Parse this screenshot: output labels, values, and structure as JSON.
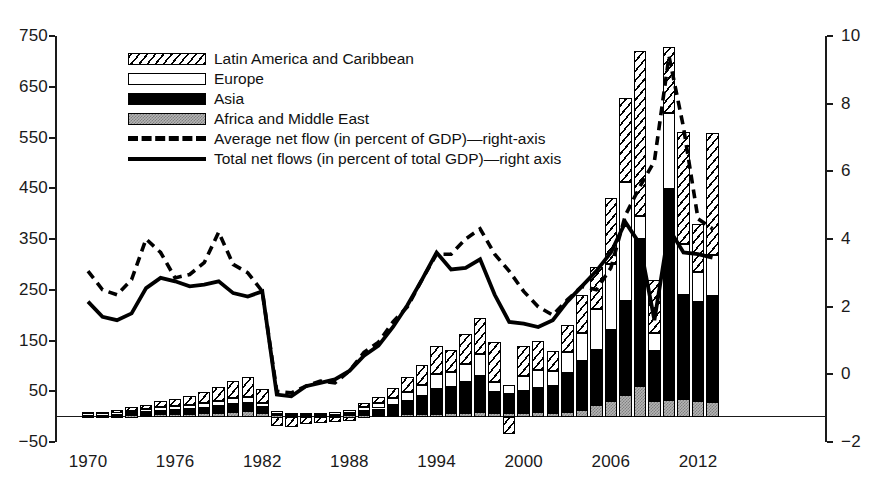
{
  "chart_data": {
    "type": "bar",
    "title": "",
    "subtitle": "",
    "xlabel": "",
    "ylabel": "",
    "grid": false,
    "legend_position": "top-center",
    "x": [
      1970,
      1971,
      1972,
      1973,
      1974,
      1975,
      1976,
      1977,
      1978,
      1979,
      1980,
      1981,
      1982,
      1983,
      1984,
      1985,
      1986,
      1987,
      1988,
      1989,
      1990,
      1991,
      1992,
      1993,
      1994,
      1995,
      1996,
      1997,
      1998,
      1999,
      2000,
      2001,
      2002,
      2003,
      2004,
      2005,
      2006,
      2007,
      2008,
      2009,
      2010,
      2011,
      2012,
      2013
    ],
    "xtick_labels": [
      "1970",
      "1976",
      "1982",
      "1988",
      "1994",
      "2000",
      "2006",
      "2012"
    ],
    "xtick_values": [
      1970,
      1976,
      1982,
      1988,
      1994,
      2000,
      2006,
      2012
    ],
    "left_axis": {
      "label": "",
      "ylim": [
        -50,
        750
      ],
      "ticks": [
        -50,
        50,
        150,
        250,
        350,
        450,
        550,
        650,
        750
      ],
      "tick_labels": [
        "−50",
        "50",
        "150",
        "250",
        "350",
        "450",
        "550",
        "650",
        "750"
      ]
    },
    "right_axis": {
      "label": "",
      "ylim": [
        -2,
        10
      ],
      "ticks": [
        -2,
        0,
        2,
        4,
        6,
        8,
        10
      ],
      "tick_labels": [
        "−2",
        "0",
        "2",
        "4",
        "6",
        "8",
        "10"
      ]
    },
    "stacked_series": [
      {
        "name": "Africa and Middle East",
        "pattern": "gray-checker",
        "axis": "left",
        "values": [
          2,
          2,
          2,
          3,
          4,
          5,
          5,
          6,
          7,
          8,
          10,
          11,
          8,
          3,
          2,
          2,
          2,
          2,
          3,
          3,
          4,
          4,
          5,
          5,
          6,
          7,
          8,
          9,
          8,
          7,
          8,
          9,
          8,
          10,
          14,
          22,
          30,
          42,
          60,
          30,
          33,
          35,
          30,
          28
        ]
      },
      {
        "name": "Asia",
        "pattern": "solid-black",
        "axis": "left",
        "values": [
          3,
          3,
          4,
          5,
          6,
          7,
          8,
          9,
          10,
          12,
          14,
          15,
          10,
          4,
          3,
          3,
          3,
          3,
          5,
          8,
          12,
          18,
          26,
          35,
          48,
          52,
          60,
          72,
          40,
          38,
          42,
          48,
          52,
          75,
          95,
          110,
          140,
          185,
          290,
          100,
          415,
          205,
          195,
          210
        ]
      },
      {
        "name": "Europe",
        "pattern": "dotted",
        "axis": "left",
        "values": [
          2,
          2,
          3,
          4,
          5,
          6,
          7,
          8,
          9,
          10,
          12,
          13,
          9,
          4,
          3,
          3,
          3,
          4,
          6,
          8,
          10,
          14,
          18,
          22,
          30,
          28,
          35,
          42,
          20,
          18,
          30,
          35,
          30,
          42,
          55,
          80,
          130,
          235,
          45,
          35,
          150,
          100,
          60,
          80
        ]
      },
      {
        "name": "Latin America and Caribbean",
        "pattern": "diagonal-hatch",
        "axis": "left",
        "values": [
          3,
          3,
          4,
          6,
          8,
          12,
          15,
          18,
          22,
          28,
          35,
          40,
          28,
          -18,
          -20,
          -15,
          -12,
          -10,
          -8,
          8,
          12,
          20,
          30,
          40,
          55,
          45,
          60,
          72,
          80,
          -35,
          60,
          58,
          40,
          53,
          75,
          82,
          130,
          165,
          325,
          105,
          130,
          220,
          95,
          240
        ]
      }
    ],
    "lines": [
      {
        "name": "Average net flow (in percent of GDP)—right-axis",
        "style": "dashed",
        "axis": "right",
        "values": [
          3.05,
          2.5,
          2.35,
          2.8,
          4.0,
          3.6,
          2.85,
          2.95,
          3.3,
          4.2,
          3.25,
          3.0,
          2.45,
          -0.5,
          -0.55,
          -0.35,
          -0.2,
          -0.25,
          0.1,
          0.65,
          0.95,
          1.55,
          2.0,
          2.8,
          3.55,
          3.55,
          4.0,
          4.3,
          3.55,
          3.05,
          2.45,
          2.0,
          1.75,
          2.2,
          2.6,
          2.5,
          3.15,
          4.7,
          5.55,
          6.3,
          9.4,
          7.3,
          4.6,
          4.3
        ]
      },
      {
        "name": "Total net flows (in percent of total GDP)—right axis",
        "style": "solid",
        "axis": "right",
        "values": [
          2.15,
          1.7,
          1.6,
          1.8,
          2.55,
          2.85,
          2.75,
          2.6,
          2.65,
          2.75,
          2.4,
          2.3,
          2.45,
          -0.6,
          -0.65,
          -0.35,
          -0.25,
          -0.15,
          0.1,
          0.55,
          0.85,
          1.4,
          2.05,
          2.8,
          3.6,
          3.1,
          3.15,
          3.4,
          2.35,
          1.55,
          1.5,
          1.4,
          1.6,
          2.15,
          2.6,
          3.05,
          3.6,
          4.5,
          3.85,
          1.6,
          4.3,
          3.6,
          3.55,
          3.45
        ]
      }
    ],
    "legend_entries": [
      {
        "label": "Latin America and Caribbean",
        "kind": "swatch",
        "pattern": "diagonal-hatch"
      },
      {
        "label": "Europe",
        "kind": "swatch",
        "pattern": "dotted"
      },
      {
        "label": "Asia",
        "kind": "swatch",
        "pattern": "solid-black"
      },
      {
        "label": "Africa and Middle East",
        "kind": "swatch",
        "pattern": "gray-checker"
      },
      {
        "label": "Average net flow (in percent of GDP)—right-axis",
        "kind": "line",
        "pattern": "dashed"
      },
      {
        "label": "Total net flows (in percent of total GDP)—right axis",
        "kind": "line",
        "pattern": "solid"
      }
    ]
  },
  "colors": {
    "ink": "#000000",
    "axis": "#1a1a1a",
    "africa_fill": "#b4b4b4",
    "asia_fill": "#000000",
    "europe_fill": "#ffffff",
    "latam_fill": "#ffffff",
    "background": "#ffffff"
  }
}
